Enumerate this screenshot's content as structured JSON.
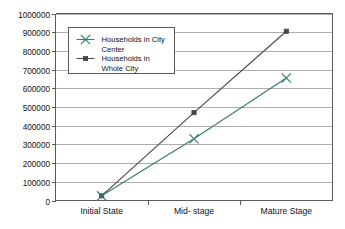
{
  "chart_data": {
    "type": "line",
    "title": "",
    "xlabel": "",
    "ylabel": "",
    "categories": [
      "Initial State",
      "Mid- stage",
      "Mature Stage"
    ],
    "series": [
      {
        "name": "Households in City Center",
        "values": [
          25000,
          330000,
          655000
        ],
        "color": "#3a7a72",
        "marker": "x"
      },
      {
        "name": "Households in Whole City",
        "values": [
          25000,
          470000,
          905000
        ],
        "color": "#4b4348",
        "marker": "square"
      }
    ],
    "ylim": [
      0,
      1000000
    ],
    "ytick_labels": [
      "0",
      "100000",
      "200000",
      "300000",
      "400000",
      "500000",
      "600000",
      "700000",
      "800000",
      "900000",
      "1000000"
    ],
    "ytick_values": [
      0,
      100000,
      200000,
      300000,
      400000,
      500000,
      600000,
      700000,
      800000,
      900000,
      1000000
    ],
    "grid": true,
    "legend_position": "upper-left-inside"
  },
  "legend": {
    "entries": [
      {
        "label_line1": "Households in City",
        "label_line2": "Center"
      },
      {
        "label_line1": "Households in",
        "label_line2": "Whole City"
      }
    ]
  },
  "colors": {
    "city_center": "#3a7a72",
    "whole_city": "#4b4348",
    "grid": "#9a9a9a",
    "axis": "#5a5a5a",
    "background": "#ffffff"
  }
}
